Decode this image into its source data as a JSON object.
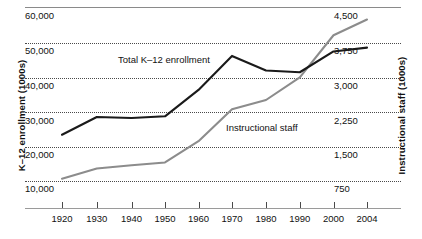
{
  "chart_data": {
    "type": "line",
    "title": "",
    "xlabel": "",
    "ylabel": "K-12 enrollment (1000s)",
    "ylabel_right": "Instructional staff (1000s)",
    "grid": true,
    "legend_position": "inline-annotation",
    "x": [
      1920,
      1930,
      1940,
      1950,
      1960,
      1970,
      1980,
      1990,
      2000,
      2004
    ],
    "xticklabels": [
      "1920",
      "1930",
      "1940",
      "1950",
      "1960",
      "1970",
      "1980",
      "1990",
      "2000",
      "2004"
    ],
    "ylim": [
      5000,
      60000
    ],
    "yticks": [
      10000,
      20000,
      30000,
      40000,
      50000,
      60000
    ],
    "yticklabels": [
      "10,000",
      "20,000",
      "30,000",
      "40,000",
      "50,000",
      "60,000"
    ],
    "ylim_right": [
      375,
      4500
    ],
    "yticks_right": [
      750,
      1500,
      2250,
      3000,
      3750,
      4500
    ],
    "yticklabels_right": [
      "750",
      "1,500",
      "2,250",
      "3,000",
      "3,750",
      "4,500"
    ],
    "series": [
      {
        "name": "Total K–12 enrollment",
        "axis": "left",
        "color": "#1a1a1a",
        "values": [
          23200,
          28300,
          28000,
          28500,
          36100,
          45900,
          41700,
          41200,
          47200,
          48300
        ]
      },
      {
        "name": "Instructional staff",
        "axis": "right",
        "color": "#8c8c8c",
        "values": [
          790,
          1010,
          1080,
          1140,
          1600,
          2290,
          2490,
          2980,
          3890,
          4230
        ]
      }
    ],
    "annotations": [
      {
        "text": "Total K–12 enrollment",
        "series": "Total K–12 enrollment"
      },
      {
        "text": "Instructional staff",
        "series": "Instructional staff"
      }
    ]
  },
  "axes": {
    "left_title": "K–12 enrollment (1000s)",
    "right_title": "Instructional staff (1000s)"
  },
  "labels": {
    "y_left": [
      "60,000",
      "50,000",
      "40,000",
      "30,000",
      "20,000",
      "10,000"
    ],
    "y_right": [
      "4,500",
      "3,750",
      "3,000",
      "2,250",
      "1,500",
      "750"
    ],
    "x": [
      "1920",
      "1930",
      "1940",
      "1950",
      "1960",
      "1970",
      "1980",
      "1990",
      "2000",
      "2004"
    ],
    "series_total": "Total K–12 enrollment",
    "series_staff": "Instructional staff"
  },
  "colors": {
    "total_line": "#1a1a1a",
    "staff_line": "#8c8c8c",
    "grid": "#4a4a4a",
    "axis": "#9a9a9a"
  }
}
